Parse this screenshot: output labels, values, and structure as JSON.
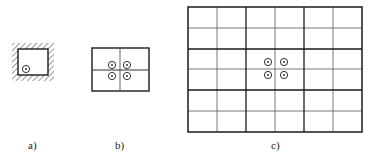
{
  "figure": {
    "panels": [
      {
        "id": "a",
        "label": "a)",
        "description": "single cell with hatched boundary and one point source",
        "grid": [
          1,
          1
        ],
        "points": 1
      },
      {
        "id": "b",
        "label": "b)",
        "description": "2x2 grid with four point sources at center",
        "grid": [
          2,
          2
        ],
        "points": 4
      },
      {
        "id": "c",
        "label": "c)",
        "description": "6x6 grid with four point sources at center",
        "grid": [
          6,
          6
        ],
        "points": 4
      }
    ],
    "colors": {
      "line": "#1a1a1a",
      "thin_line": "#555555",
      "background": "#ffffff"
    }
  }
}
